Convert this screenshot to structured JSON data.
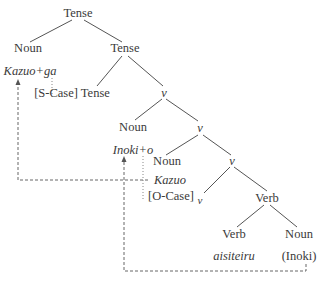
{
  "diagram": {
    "type": "syntax-tree",
    "nodes": [
      {
        "id": "tense-root",
        "label": "Tense"
      },
      {
        "id": "noun-subj",
        "label": "Noun",
        "word": "Kazuo+ga"
      },
      {
        "id": "tense-bar",
        "label": "Tense"
      },
      {
        "id": "tense-head",
        "label": "[S-Case] Tense"
      },
      {
        "id": "v-1",
        "label": "v"
      },
      {
        "id": "noun-obj-moved",
        "label": "Noun",
        "word": "Inoki+o"
      },
      {
        "id": "v-2",
        "label": "v"
      },
      {
        "id": "noun-subj-base",
        "label": "Noun",
        "word": "Kazuo"
      },
      {
        "id": "v-3",
        "label": "v"
      },
      {
        "id": "v-head",
        "label": "v",
        "feature": "[O-Case]"
      },
      {
        "id": "verb-phrase",
        "label": "Verb"
      },
      {
        "id": "verb-head",
        "label": "Verb",
        "word": "aisiteiru"
      },
      {
        "id": "noun-obj-base",
        "label": "Noun",
        "word": "(Inoki)"
      }
    ],
    "movement_arrows": [
      {
        "from": "Kazuo",
        "to": "Kazuo+ga",
        "style": "dashed"
      },
      {
        "from": "(Inoki)",
        "to": "Inoki+o",
        "style": "dashed"
      }
    ],
    "agreement_links": [
      {
        "from": "Kazuo+ga",
        "to": "[S-Case] Tense",
        "style": "dotted"
      },
      {
        "from": "Inoki+o",
        "to": "[O-Case]",
        "style": "dotted"
      }
    ]
  },
  "labels": {
    "tense_root": "Tense",
    "noun_subj": "Noun",
    "kazuo_ga": "Kazuo+ga",
    "tense_bar": "Tense",
    "s_case": "[S-Case] Tense",
    "v1": "v",
    "noun_obj": "Noun",
    "inoki_o": "Inoki+o",
    "v2": "v",
    "noun_subj_base": "Noun",
    "v3": "v",
    "kazuo": "Kazuo",
    "o_case": "[O-Case]",
    "v_head": "v",
    "verb_phrase": "Verb",
    "verb_head": "Verb",
    "aisiteiru": "aisiteiru",
    "noun_obj_base": "Noun",
    "inoki_trace": "(Inoki)"
  }
}
